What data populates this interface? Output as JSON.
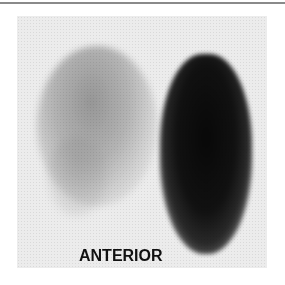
{
  "figure": {
    "view_label": "ANTERIOR",
    "colors": {
      "background": "#ececec",
      "intense_uptake": "#0a0a0a",
      "mild_uptake": "#8c8c8c",
      "label": "#111111"
    }
  }
}
